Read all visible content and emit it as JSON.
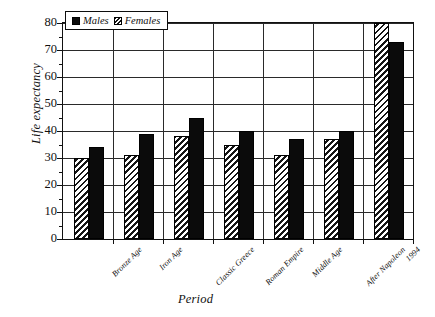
{
  "chart_data": {
    "type": "bar",
    "title": "",
    "xlabel": "Period",
    "ylabel": "Life expectancy",
    "categories": [
      "Bronze Age",
      "Iron Age",
      "Classic Greece",
      "Roman Empire",
      "Middle Age",
      "After Napoleon",
      "1994"
    ],
    "series": [
      {
        "name": "Females",
        "values": [
          30,
          31,
          38,
          35,
          31,
          37,
          80
        ]
      },
      {
        "name": "Males",
        "values": [
          34,
          39,
          45,
          40,
          37,
          40,
          73
        ]
      }
    ],
    "ylim": [
      0,
      80
    ],
    "yticks": [
      0,
      10,
      20,
      30,
      40,
      50,
      60,
      70,
      80
    ],
    "ytick_labels": [
      "0",
      "10",
      "20",
      "30",
      "40",
      "50",
      "60",
      "70",
      "80"
    ],
    "grid": true,
    "legend_position": "top-left-inside",
    "legend_entries": [
      "Males",
      "Females"
    ],
    "colors": {
      "males": "#0b0b0b",
      "females_hatch": "#141414",
      "axis": "#111111",
      "grid": "#2a2a2a",
      "background": "#ffffff"
    }
  }
}
